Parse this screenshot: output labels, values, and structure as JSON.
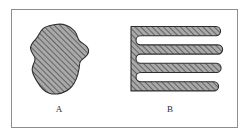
{
  "figure": {
    "caption": "",
    "background_color": "#ffffff",
    "frame": {
      "border_color": "#8d8d8d",
      "border_width": 1,
      "x": 11,
      "y": 9,
      "width": 227,
      "height": 119
    },
    "fill_color": "#a8a8a8",
    "hatch_color": "#4a4a4a",
    "outline_color": "#2e2e2e",
    "hatch_angle_degrees": 45
  },
  "shapes": [
    {
      "id": "A",
      "label": "A",
      "name": "compact-blob-shape",
      "description": "Irregular compact amoeba-like blob with diagonal hatching",
      "fill": "#a8a8a8",
      "outline": "#2e2e2e",
      "label_x": 57,
      "label_y": 109
    },
    {
      "id": "B",
      "label": "B",
      "name": "serpentine-band-shape",
      "description": "Serpentine meandering band folded into six horizontal arms joined at the left spine",
      "fill": "#a8a8a8",
      "outline": "#2e2e2e",
      "arm_count": 6,
      "label_x": 170,
      "label_y": 109
    }
  ]
}
